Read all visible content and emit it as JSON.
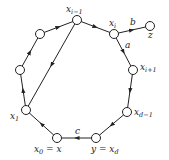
{
  "diagram": {
    "type": "directed-cycle-graph",
    "colors": {
      "stroke": "#222222",
      "node_fill": "#ffffff",
      "background": "#ffffff"
    },
    "nodes": [
      {
        "id": "x_im1",
        "x": 77,
        "y": 20,
        "label": "x",
        "sub": "i−1"
      },
      {
        "id": "x_i",
        "x": 114,
        "y": 34,
        "label": "x",
        "sub": "i"
      },
      {
        "id": "z",
        "x": 150,
        "y": 26,
        "label": "z",
        "sub": ""
      },
      {
        "id": "x_ip1",
        "x": 133,
        "y": 70,
        "label": "x",
        "sub": "i+1"
      },
      {
        "id": "x_dm1",
        "x": 127,
        "y": 112,
        "label": "x",
        "sub": "d−1"
      },
      {
        "id": "y",
        "x": 96,
        "y": 138,
        "label": "y = x",
        "sub": "d"
      },
      {
        "id": "x_0",
        "x": 57,
        "y": 138,
        "label": "x",
        "sub": "0",
        "suffix": " = x"
      },
      {
        "id": "x_1",
        "x": 26,
        "y": 110,
        "label": "x",
        "sub": "1"
      },
      {
        "id": "v_left",
        "x": 20,
        "y": 70,
        "label": "",
        "sub": ""
      },
      {
        "id": "v_upper_left",
        "x": 40,
        "y": 34,
        "label": "",
        "sub": ""
      }
    ],
    "edges": [
      {
        "from": "x_1",
        "to": "v_left",
        "label": ""
      },
      {
        "from": "v_left",
        "to": "v_upper_left",
        "label": ""
      },
      {
        "from": "v_upper_left",
        "to": "x_im1",
        "label": ""
      },
      {
        "from": "x_im1",
        "to": "x_i",
        "label": ""
      },
      {
        "from": "x_i",
        "to": "z",
        "label": "b"
      },
      {
        "from": "x_i",
        "to": "x_ip1",
        "label": "a"
      },
      {
        "from": "x_ip1",
        "to": "x_dm1",
        "label": ""
      },
      {
        "from": "x_dm1",
        "to": "y",
        "label": ""
      },
      {
        "from": "y",
        "to": "x_0",
        "label": "c"
      },
      {
        "from": "x_0",
        "to": "x_1",
        "label": ""
      },
      {
        "from": "x_im1",
        "to": "x_1",
        "label": ""
      }
    ],
    "labels": {
      "x_im1": {
        "base": "x",
        "sub": "i−1"
      },
      "x_i": {
        "base": "x",
        "sub": "i"
      },
      "z": {
        "base": "z"
      },
      "x_ip1": {
        "base": "x",
        "sub": "i+1"
      },
      "x_dm1": {
        "base": "x",
        "sub": "d−1"
      },
      "y": {
        "base": "y = x",
        "sub": "d"
      },
      "x_0": {
        "base": "x",
        "sub": "0",
        "suffix": " = x"
      },
      "x_1": {
        "base": "x",
        "sub": "1"
      },
      "edge_a": "a",
      "edge_b": "b",
      "edge_c": "c"
    }
  }
}
